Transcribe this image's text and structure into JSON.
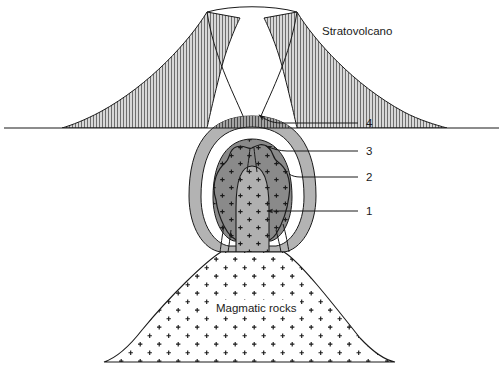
{
  "figure": {
    "title_label": "Stratovolcano",
    "basement_label": "Magmatic rocks",
    "callouts": [
      {
        "id": "callout-4",
        "number": "4",
        "x": 366,
        "y": 124
      },
      {
        "id": "callout-3",
        "number": "3",
        "x": 366,
        "y": 152
      },
      {
        "id": "callout-2",
        "number": "2",
        "x": 366,
        "y": 178
      },
      {
        "id": "callout-1",
        "number": "1",
        "x": 366,
        "y": 212
      }
    ],
    "colors": {
      "outline": "#1a1a1a",
      "background": "#ffffff",
      "cone_hatch": "#8c8c8c",
      "chamber_outer": "#b3b3b3",
      "chamber_ring": "#ffffff",
      "chamber_mid": "#8a8a8a",
      "chamber_core": "#b0b0b0",
      "basement_fill": "#ffffff",
      "plus_mark": "#1a1a1a"
    },
    "geometry": {
      "ground_line_y": 128,
      "summit_y": 12,
      "summit_left_x": 207,
      "summit_right_x": 297,
      "cone_left_base_x": 62,
      "cone_right_base_x": 447
    }
  }
}
